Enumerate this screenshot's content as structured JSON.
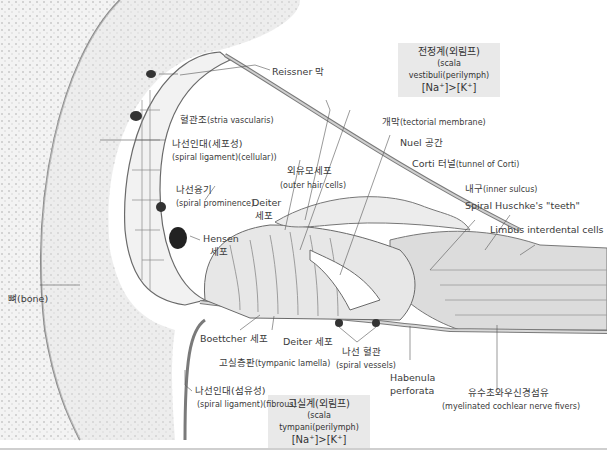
{
  "scala_vestibuli": {
    "ko": "전정계(외림프)",
    "en": "(scala vestibuli(perilymph)",
    "ion": "[Na⁺]>[K⁺]"
  },
  "scala_tympani": {
    "ko": "고실계(외림프)",
    "en": "(scala tympani(perilymph)",
    "ion": "[Na⁺]>[K⁺]"
  },
  "labels": {
    "reissner": "Reissner 막",
    "stria_ko": "혈관조",
    "stria_en": "(stria vascularis)",
    "spiral_lig_cell_ko": "나선인대(세포성)",
    "spiral_lig_cell_en": "(spiral ligament)(cellular))",
    "tectorial_ko": "개막",
    "tectorial_en": "(tectorial membrane)",
    "nuel": "Nuel 공간",
    "corti_ko": "Corti 터널",
    "corti_en": "(tunnel of Corti)",
    "ohc_ko": "외유모세포",
    "ohc_en": "(outer hair cells)",
    "prominence_ko": "나선융기",
    "prominence_en": "(spiral prominence)",
    "deiter_top": "Deiter",
    "deiter_top2": "세포",
    "inner_sulcus_ko": "내구",
    "inner_sulcus_en": "(inner sulcus)",
    "huschke": "Spiral Huschke's \"teeth\"",
    "limbus": "Limbus interdental cells",
    "hensen": "Hensen",
    "hensen2": "세포",
    "bone": "뼈(bone)",
    "boettcher": "Boettcher 세포",
    "deiter_bottom": "Deiter 세포",
    "tympanic_ko": "고실층판",
    "tympanic_en": "(tympanic lamella)",
    "vessels_ko": "나선 혈관",
    "vessels_en": "(spiral vessels)",
    "habenula1": "Habenula",
    "habenula2": "perforata",
    "spiral_lig_fib_ko": "나선인대(섬유성)",
    "spiral_lig_fib_en": "(spiral ligament)(fibrous)",
    "nerve_ko": "유수초와우신경섬유",
    "nerve_en": "(myelinated cochlear nerve fivers)"
  },
  "colors": {
    "bone": "#e6e6e6",
    "bone_dots": "#b5b5b5",
    "tissue": "#d9d9d9",
    "cell_stroke": "#6a6a6a",
    "box": "#e9e9e9"
  }
}
